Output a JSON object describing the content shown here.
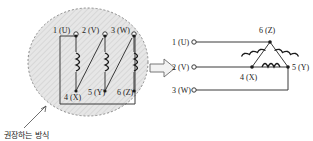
{
  "figure": {
    "title": "",
    "type": "motor-winding-connection-diagram",
    "transition_icon": "right-arrow-icon"
  },
  "left_panel": {
    "region_shape": "dashed-circle",
    "caption": "권장하는 방식",
    "top_terminals": [
      {
        "id": "t1",
        "label": "1 (U)"
      },
      {
        "id": "t2",
        "label": "2 (V)"
      },
      {
        "id": "t3",
        "label": "3 (W)"
      }
    ],
    "bottom_terminals": [
      {
        "id": "t4",
        "label": "4 (X)"
      },
      {
        "id": "t5",
        "label": "5 (Y)"
      },
      {
        "id": "t6",
        "label": "6 (Z)"
      }
    ],
    "coils": [
      {
        "id": "coil-u-x",
        "between": "1 (U) - 4 (X)"
      },
      {
        "id": "coil-v-y",
        "between": "2 (V) - 5 (Y)"
      },
      {
        "id": "coil-w-z",
        "between": "3 (W) - 6 (Z)"
      }
    ]
  },
  "right_panel": {
    "connection_type": "delta",
    "left_terminals": [
      {
        "id": "r1",
        "label": "1 (U)"
      },
      {
        "id": "r2",
        "label": "2 (V)"
      },
      {
        "id": "r3",
        "label": "3 (W)"
      }
    ],
    "vertex_labels": [
      {
        "id": "v6",
        "label": "6 (Z)"
      },
      {
        "id": "v4",
        "label": "4 (X)"
      },
      {
        "id": "v5",
        "label": "5 (Y)"
      }
    ],
    "coils": [
      {
        "id": "coil-left-leg",
        "between": "4 (X) - 6 (Z)"
      },
      {
        "id": "coil-right-leg",
        "between": "6 (Z) - 5 (Y)"
      },
      {
        "id": "coil-bottom-leg",
        "between": "4 (X) - 5 (Y)"
      }
    ]
  },
  "colors": {
    "wire": "#3a3a3a",
    "coil": "#1a1a1a",
    "text": "#1a1a1a",
    "region_fill": "#e4e4e4",
    "region_stroke": "#8a8a8a",
    "background": "#ffffff"
  }
}
